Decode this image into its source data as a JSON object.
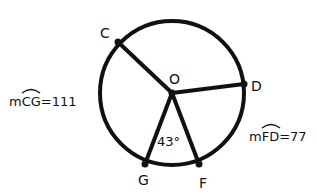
{
  "diagram": {
    "type": "circle-geometry",
    "center": {
      "label": "O",
      "x": 172,
      "y": 93
    },
    "radius": 72,
    "points": [
      {
        "label": "C",
        "x": 118,
        "y": 42,
        "lx": 100,
        "ly": 38
      },
      {
        "label": "D",
        "x": 244,
        "y": 84,
        "lx": 251,
        "ly": 91
      },
      {
        "label": "G",
        "x": 145,
        "y": 164,
        "lx": 138,
        "ly": 185
      },
      {
        "label": "F",
        "x": 199,
        "y": 164,
        "lx": 199,
        "ly": 188
      }
    ],
    "angle_label": "43°",
    "arc_labels": {
      "cg": {
        "prefix": "m",
        "arc": "CG",
        "value": "=111"
      },
      "fd": {
        "prefix": "m",
        "arc": "FD",
        "value": "=77"
      }
    },
    "colors": {
      "stroke": "#111111",
      "background": "#ffffff"
    }
  }
}
